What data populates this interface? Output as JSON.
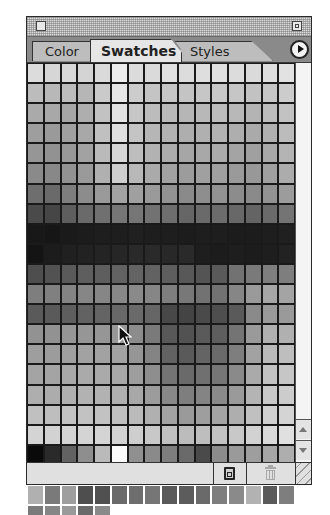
{
  "window": {
    "close_box": "close-box",
    "zoom_box": "zoom-box"
  },
  "tabs": [
    {
      "label": "Color",
      "active": false
    },
    {
      "label": "Swatches",
      "active": true
    },
    {
      "label": "Styles",
      "active": false
    }
  ],
  "menu_button": {
    "icon": "triangle-right-icon"
  },
  "swatches": {
    "columns": 16,
    "rows": [
      [
        "#dcdcdc",
        "#d6d6d6",
        "#d8d8d8",
        "#d4d4d4",
        "#dadada",
        "#ececec",
        "#dcdcdc",
        "#dadada",
        "#e0e0e0",
        "#dcdcdc",
        "#dedede",
        "#e0e0e0",
        "#dcdcdc",
        "#dadada",
        "#dedede",
        "#e2e2e2"
      ],
      [
        "#bcbcbc",
        "#b8b8b8",
        "#bcbcbc",
        "#b6b6b6",
        "#cacaca",
        "#e6e6e6",
        "#cccccc",
        "#c4c4c4",
        "#c6c6c6",
        "#c4c4c4",
        "#c6c6c6",
        "#c8c8c8",
        "#c6c6c6",
        "#c2c2c2",
        "#c6c6c6",
        "#cccccc"
      ],
      [
        "#aaaaaa",
        "#a8a8a8",
        "#a6a6a6",
        "#aeaeae",
        "#c2c2c2",
        "#e2e2e2",
        "#c6c6c6",
        "#bcbcbc",
        "#bababa",
        "#b6b6b6",
        "#b8b8b8",
        "#bcbcbc",
        "#b8b8b8",
        "#b4b4b4",
        "#bcbcbc",
        "#c2c2c2"
      ],
      [
        "#9e9e9e",
        "#9a9a9a",
        "#a0a0a0",
        "#a8a8a8",
        "#c0c0c0",
        "#dedede",
        "#c4c4c4",
        "#b6b6b6",
        "#b2b2b2",
        "#aeaeae",
        "#b0b0b0",
        "#b2b2b2",
        "#aeaeae",
        "#aaaaaa",
        "#b0b0b0",
        "#bcbcbc"
      ],
      [
        "#969696",
        "#929292",
        "#989898",
        "#a2a2a2",
        "#bababa",
        "#d6d6d6",
        "#bebebe",
        "#b2b2b2",
        "#acacac",
        "#a6a6a6",
        "#a8a8a8",
        "#aaaaaa",
        "#a4a4a4",
        "#a0a0a0",
        "#a8a8a8",
        "#b4b4b4"
      ],
      [
        "#8a8a8a",
        "#888888",
        "#929292",
        "#9a9a9a",
        "#b0b0b0",
        "#cecece",
        "#b8b8b8",
        "#aaaaaa",
        "#a2a2a2",
        "#9c9c9c",
        "#a0a0a0",
        "#a0a0a0",
        "#9a9a9a",
        "#989898",
        "#a0a0a0",
        "#acacac"
      ],
      [
        "#6e6e6e",
        "#6a6a6a",
        "#7e7e7e",
        "#8c8c8c",
        "#9a9a9a",
        "#a2a2a2",
        "#a0a0a0",
        "#9a9a9a",
        "#929292",
        "#8a8a8a",
        "#8e8e8e",
        "#929292",
        "#8c8c8c",
        "#8a8a8a",
        "#929292",
        "#9c9c9c"
      ],
      [
        "#4a4a4a",
        "#464646",
        "#5e5e5e",
        "#6a6a6a",
        "#707070",
        "#767676",
        "#767676",
        "#727272",
        "#6e6e6e",
        "#666666",
        "#6a6a6a",
        "#6c6c6c",
        "#686868",
        "#646464",
        "#6a6a6a",
        "#747474"
      ],
      [
        "#181818",
        "#161616",
        "#1a1a1a",
        "#1c1c1c",
        "#1e1e1e",
        "#1e1e1e",
        "#202020",
        "#1e1e1e",
        "#1e1e1e",
        "#1c1c1c",
        "#1e1e1e",
        "#1e1e1e",
        "#1c1c1c",
        "#1c1c1c",
        "#1e1e1e",
        "#202020"
      ],
      [
        "#141414",
        "#1c1c1c",
        "#202020",
        "#222222",
        "#242424",
        "#262626",
        "#2a2a2a",
        "#2a2a2a",
        "#282828",
        "#2a2a2a",
        "#1e1e1e",
        "#1c1c1c",
        "#1e1e1e",
        "#1c1c1c",
        "#1e1e1e",
        "#222222"
      ],
      [
        "#4e4e4e",
        "#525252",
        "#5a5a5a",
        "#5e5e5e",
        "#5e5e5e",
        "#626262",
        "#646464",
        "#626262",
        "#5e5e5e",
        "#585858",
        "#545454",
        "#5a5a5a",
        "#727272",
        "#7a7a7a",
        "#7e7e7e",
        "#7e7e7e"
      ],
      [
        "#7e7e7e",
        "#808080",
        "#848484",
        "#868686",
        "#868686",
        "#888888",
        "#8a8a8a",
        "#868686",
        "#7e7e7e",
        "#787878",
        "#727272",
        "#727272",
        "#868686",
        "#9a9a9a",
        "#a6a6a6",
        "#a4a4a4"
      ],
      [
        "#5a5a5a",
        "#5a5a5a",
        "#5e5e5e",
        "#626262",
        "#646464",
        "#686868",
        "#6a6a6a",
        "#666666",
        "#484848",
        "#444444",
        "#4a4a4a",
        "#4e4e4e",
        "#5a5a5a",
        "#8a8a8a",
        "#9a9a9a",
        "#9a9a9a"
      ],
      [
        "#929292",
        "#929292",
        "#969696",
        "#969696",
        "#969696",
        "#989898",
        "#8c8c8c",
        "#7a7a7a",
        "#585858",
        "#525252",
        "#5a5a5a",
        "#5e5e5e",
        "#747474",
        "#9a9a9a",
        "#b0b0b0",
        "#b0b0b0"
      ],
      [
        "#9e9e9e",
        "#9c9c9c",
        "#a0a0a0",
        "#a2a2a2",
        "#a2a2a2",
        "#a2a2a2",
        "#969696",
        "#848484",
        "#626262",
        "#5a5a5a",
        "#646464",
        "#6a6a6a",
        "#7e7e7e",
        "#a2a2a2",
        "#bababa",
        "#bebebe"
      ],
      [
        "#a4a4a4",
        "#a4a4a4",
        "#a8a8a8",
        "#aaaaaa",
        "#aaaaaa",
        "#a8a8a8",
        "#9e9e9e",
        "#8e8e8e",
        "#747474",
        "#6a6a6a",
        "#707070",
        "#767676",
        "#8a8a8a",
        "#aaaaaa",
        "#c2c2c2",
        "#c6c6c6"
      ],
      [
        "#aeaeae",
        "#acacac",
        "#b0b0b0",
        "#b2b2b2",
        "#b2b2b2",
        "#b0b0b0",
        "#a8a8a8",
        "#9c9c9c",
        "#888888",
        "#7e7e7e",
        "#848484",
        "#8a8a8a",
        "#9a9a9a",
        "#b4b4b4",
        "#c8c8c8",
        "#cccccc"
      ],
      [
        "#c0c0c0",
        "#bebebe",
        "#c2c2c2",
        "#c2c2c2",
        "#c2c2c2",
        "#c0c0c0",
        "#bababa",
        "#b0b0b0",
        "#a2a2a2",
        "#9a9a9a",
        "#9e9e9e",
        "#a4a4a4",
        "#aeaeae",
        "#c0c0c0",
        "#d0d0d0",
        "#d4d4d4"
      ],
      [
        "#d4d4d4",
        "#d2d2d2",
        "#d4d4d4",
        "#d4d4d4",
        "#d4d4d4",
        "#d2d2d2",
        "#cecece",
        "#c8c8c8",
        "#c0c0c0",
        "#bcbcbc",
        "#bebebe",
        "#c2c2c2",
        "#c8c8c8",
        "#d2d2d2",
        "#dadada",
        "#e0e0e0"
      ],
      [
        "#0a0a0a",
        "#2a2a2a",
        "#626262",
        "#8e8e8e",
        "#bababa",
        "#fafafa",
        "#909090",
        "#8a8a8a",
        "#7e7e7e",
        "#6a6a6a",
        "#4a4a4a",
        "#8c8c8c",
        "#9a9a9a",
        "#9e9e9e",
        "#a6a6a6",
        "#aeaeae"
      ],
      [
        "#8a8a8a",
        "#8e8e8e",
        "#b4b4b4",
        "#9c9c9c",
        "#7a7a7a",
        "#9a9a9a",
        "#a0a0a0",
        "#8e8e8e",
        "#969696",
        "#808080",
        "#4e4e4e",
        "#9a9a9a",
        "#a2a2a2",
        "#a6a6a6",
        "#a2a2a2",
        "#969696"
      ],
      [
        "#b0b0b0",
        "#7a7a7a",
        "#9e9e9e",
        "#4e4e4e",
        "#505050",
        "#6a6a6a",
        "#6e6e6e",
        "#767676",
        "#5a5a5a",
        "#5c5c5c",
        "#6a6a6a",
        "#7e7e7e",
        "#8a8a8a",
        "#b2b2b2",
        "#5a5a5a",
        "#7e7e7e"
      ],
      [
        "#7a7a7a",
        "#868686",
        "#9a9a9a",
        "#6a6a6a",
        "#8a8a8a"
      ]
    ]
  },
  "scrollbar": {
    "up_icon": "scroll-up-arrow-icon",
    "down_icon": "scroll-down-arrow-icon"
  },
  "bottom_bar": {
    "new_swatch_icon": "new-swatch-icon",
    "delete_icon": "trash-icon",
    "resize_icon": "resize-grip-icon"
  }
}
